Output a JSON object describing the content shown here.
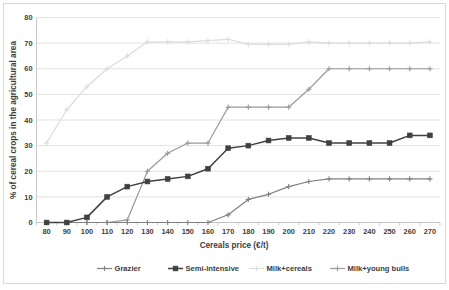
{
  "chart_data": {
    "type": "line",
    "title": "",
    "xlabel": "Cereals price (€/t)",
    "ylabel": "% of cereal crops in the agricultural area",
    "categories": [
      80,
      90,
      100,
      110,
      120,
      130,
      140,
      150,
      160,
      170,
      180,
      190,
      200,
      210,
      220,
      230,
      240,
      250,
      260,
      270
    ],
    "xtick_labels": [
      "80",
      "90",
      "100",
      "110",
      "120",
      "130",
      "140",
      "150",
      "160",
      "170",
      "180",
      "190",
      "200",
      "210",
      "220",
      "230",
      "240",
      "250",
      "260",
      "270"
    ],
    "ytick_labels": [
      "0",
      "10",
      "20",
      "30",
      "40",
      "50",
      "60",
      "70",
      "80"
    ],
    "ylim": [
      0,
      80
    ],
    "ytick_step": 10,
    "grid": true,
    "legend_position": "bottom",
    "series": [
      {
        "name": "Grazier",
        "color": "#808080",
        "marker": "cross",
        "values": [
          0,
          0,
          0,
          0,
          0,
          0,
          0,
          0,
          0,
          3,
          9,
          11,
          14,
          16,
          17,
          17,
          17,
          17,
          17,
          17
        ]
      },
      {
        "name": "Semi-intensive",
        "color": "#404040",
        "marker": "square",
        "values": [
          0,
          0,
          2,
          10,
          14,
          16,
          17,
          18,
          21,
          29,
          30,
          32,
          33,
          33,
          31,
          31,
          31,
          31,
          34,
          34
        ]
      },
      {
        "name": "Milk+cereals",
        "color": "#dcdcdc",
        "marker": "cross",
        "values": [
          31,
          44,
          53,
          60,
          65,
          70.5,
          70.5,
          70.5,
          71,
          71.5,
          69.5,
          69.5,
          69.5,
          70.5,
          70,
          70,
          70,
          70,
          70,
          70.5
        ]
      },
      {
        "name": "Milk+young bulls",
        "color": "#9a9a9a",
        "marker": "cross",
        "values": [
          0,
          0,
          0,
          0,
          1,
          20,
          27,
          31,
          31,
          45,
          45,
          45,
          45,
          52,
          60,
          60,
          60,
          60,
          60,
          60
        ]
      }
    ]
  },
  "legend": {
    "items": [
      {
        "label": "Grazier"
      },
      {
        "label": "Semi-intensive"
      },
      {
        "label": "Milk+cereals"
      },
      {
        "label": "Milk+young bulls"
      }
    ]
  }
}
